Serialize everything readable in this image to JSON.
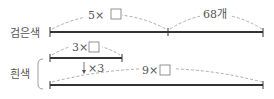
{
  "diagram": {
    "black": {
      "label": "검은색",
      "segment1": "5×",
      "segment2": "68개"
    },
    "white": {
      "label": "흰색",
      "short_bar": "3×",
      "multiplier": "×3",
      "long_bar": "9×"
    },
    "colors": {
      "line": "#333333",
      "dashed": "#999999",
      "text": "#555555"
    }
  }
}
